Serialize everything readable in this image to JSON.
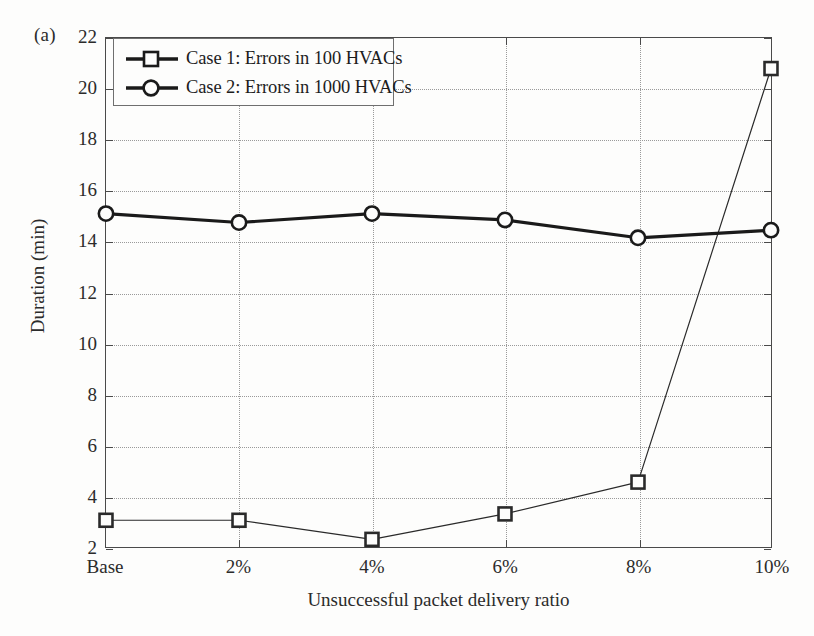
{
  "panel": {
    "letter": "(a)"
  },
  "axes": {
    "x_title": "Unsuccessful packet delivery ratio",
    "y_title": "Duration (min)",
    "y_ticks": [
      "2",
      "4",
      "6",
      "8",
      "10",
      "12",
      "14",
      "16",
      "18",
      "20",
      "22"
    ],
    "x_ticks": [
      "Base",
      "2%",
      "4%",
      "6%",
      "8%",
      "10%"
    ]
  },
  "legend": {
    "items": [
      {
        "label": "Case 1: Errors in 100 HVACs",
        "marker": "square-marker"
      },
      {
        "label": "Case 2: Errors in 1000 HVACs",
        "marker": "circle-marker"
      }
    ]
  },
  "chart_data": {
    "type": "line",
    "title": "",
    "subtitle": "",
    "xlabel": "Unsuccessful packet delivery ratio",
    "ylabel": "Duration (min)",
    "categories": [
      "Base",
      "2%",
      "4%",
      "6%",
      "8%",
      "10%"
    ],
    "series": [
      {
        "name": "Case 1: Errors in 100 HVACs",
        "marker": "square",
        "color": "#2a2a2a",
        "line_width": 1.2,
        "values": [
          3.05,
          3.05,
          2.3,
          3.3,
          4.55,
          20.8
        ]
      },
      {
        "name": "Case 2: Errors in 1000 HVACs",
        "marker": "circle",
        "color": "#1a1a1a",
        "line_width": 3.2,
        "values": [
          15.1,
          14.75,
          15.1,
          14.85,
          14.15,
          14.45
        ]
      }
    ],
    "ylim": [
      2,
      22
    ],
    "ytick_step": 2,
    "grid": true,
    "grid_style": "dotted",
    "legend_position": "top-left",
    "background": "#fdfdfc"
  }
}
